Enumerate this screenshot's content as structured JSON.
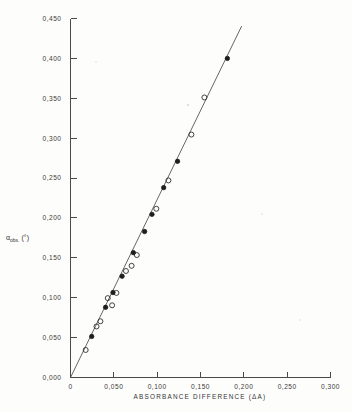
{
  "figure": {
    "name": "absorbance-difference-calibration-plot",
    "background_color": "#fdfdfc",
    "line_color": "#555555",
    "marker_open_color": "#2e2e2e",
    "marker_filled_color": "#1e1e1e"
  },
  "chart_data": {
    "type": "scatter",
    "title": "",
    "subtitle": "",
    "xlabel": "ABSORBANCE DIFFERENCE (ΔA)",
    "ylabel": "αobs. (°)",
    "ylabel_parts": {
      "symbol": "α",
      "subscript": "obs.",
      "units": "(°)"
    },
    "xlim": [
      0.0,
      0.3
    ],
    "ylim": [
      0.0,
      0.45
    ],
    "grid": false,
    "legend_position": "none",
    "xticks": [
      0.0,
      0.05,
      0.1,
      0.15,
      0.2,
      0.25,
      0.3
    ],
    "xticklabels": [
      "0",
      "0,050",
      "0,100",
      "0,150",
      "0,200",
      "0,250",
      "0,300"
    ],
    "yticks": [
      0.0,
      0.05,
      0.1,
      0.15,
      0.2,
      0.25,
      0.3,
      0.35,
      0.4,
      0.45
    ],
    "yticklabels": [
      "0,000",
      "0,050",
      "0,100",
      "0,150",
      "0,200",
      "0,250",
      "0,300",
      "0,350",
      "0,400",
      "0,450"
    ],
    "fit_line": {
      "name": "linear-regression-through-origin",
      "x_start": 0.0,
      "y_start": 0.0,
      "x_end": 0.1975,
      "y_end": 0.4405,
      "slope": 2.23,
      "intercept": 0.0
    },
    "series": [
      {
        "name": "open-circles",
        "marker": "open-circle",
        "points": [
          [
            0.0175,
            0.0345
          ],
          [
            0.03,
            0.064
          ],
          [
            0.0345,
            0.0705
          ],
          [
            0.043,
            0.0995
          ],
          [
            0.048,
            0.0905
          ],
          [
            0.053,
            0.106
          ],
          [
            0.064,
            0.1335
          ],
          [
            0.0705,
            0.14
          ],
          [
            0.0765,
            0.1535
          ],
          [
            0.099,
            0.2115
          ],
          [
            0.113,
            0.247
          ],
          [
            0.1395,
            0.3045
          ],
          [
            0.1545,
            0.351
          ]
        ]
      },
      {
        "name": "filled-circles",
        "marker": "filled-circle",
        "points": [
          [
            0.0245,
            0.0515
          ],
          [
            0.0405,
            0.088
          ],
          [
            0.049,
            0.1065
          ],
          [
            0.0595,
            0.127
          ],
          [
            0.0725,
            0.1565
          ],
          [
            0.0855,
            0.183
          ],
          [
            0.094,
            0.2045
          ],
          [
            0.1075,
            0.238
          ],
          [
            0.1235,
            0.271
          ],
          [
            0.181,
            0.4
          ]
        ]
      }
    ]
  }
}
